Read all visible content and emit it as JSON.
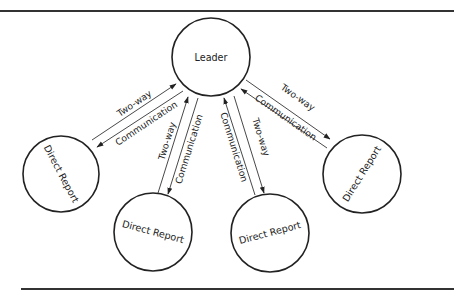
{
  "diagram": {
    "type": "hub-and-spoke",
    "center_node": {
      "label": "Leader"
    },
    "nodes": [
      {
        "id": "dr1",
        "label": "Direct Report"
      },
      {
        "id": "dr2",
        "label": "Direct Report"
      },
      {
        "id": "dr3",
        "label": "Direct Report"
      },
      {
        "id": "dr4",
        "label": "Direct Report"
      }
    ],
    "edges": [
      {
        "to": "dr1",
        "upstream_label": "Two-way",
        "downstream_label": "Communication"
      },
      {
        "to": "dr2",
        "upstream_label": "Two-way",
        "downstream_label": "Communication"
      },
      {
        "to": "dr3",
        "upstream_label": "Communication",
        "downstream_label": "Two-way"
      },
      {
        "to": "dr4",
        "upstream_label": "Communication",
        "downstream_label": "Two-way"
      }
    ],
    "colors": {
      "stroke": "#222222",
      "background": "#ffffff"
    }
  }
}
